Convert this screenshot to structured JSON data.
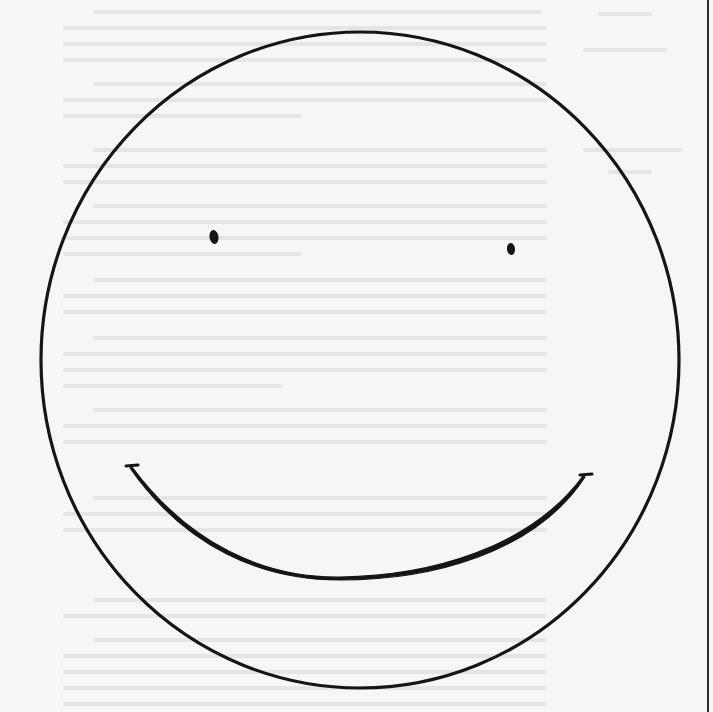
{
  "canvas": {
    "width": 713,
    "height": 712,
    "background": "#f6f6f4",
    "ink": "#151515"
  },
  "illustration": {
    "subject": "hand-drawn smiley face",
    "face": {
      "cx": 360,
      "cy": 360,
      "rx": 319,
      "ry": 328,
      "stroke_width": 3.2
    },
    "eyes": [
      {
        "cx": 214,
        "cy": 237,
        "rx": 4.5,
        "ry": 7
      },
      {
        "cx": 511,
        "cy": 249,
        "rx": 4,
        "ry": 6
      }
    ],
    "mouth": {
      "start": [
        132,
        467
      ],
      "end": [
        583,
        476
      ],
      "lowest_point": [
        340,
        577
      ]
    }
  },
  "page_rule": {
    "x": 708,
    "color": "#2a2a2a"
  }
}
